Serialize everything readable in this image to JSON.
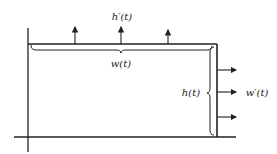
{
  "diagram": {
    "labels": {
      "top_rate": "h′(t)",
      "width": "w(t)",
      "height": "h(t)",
      "side_rate": "w′(t)"
    },
    "colors": {
      "stroke": "#222222",
      "background": "#ffffff"
    },
    "arrows": {
      "up_count": 3,
      "right_count": 3
    }
  }
}
